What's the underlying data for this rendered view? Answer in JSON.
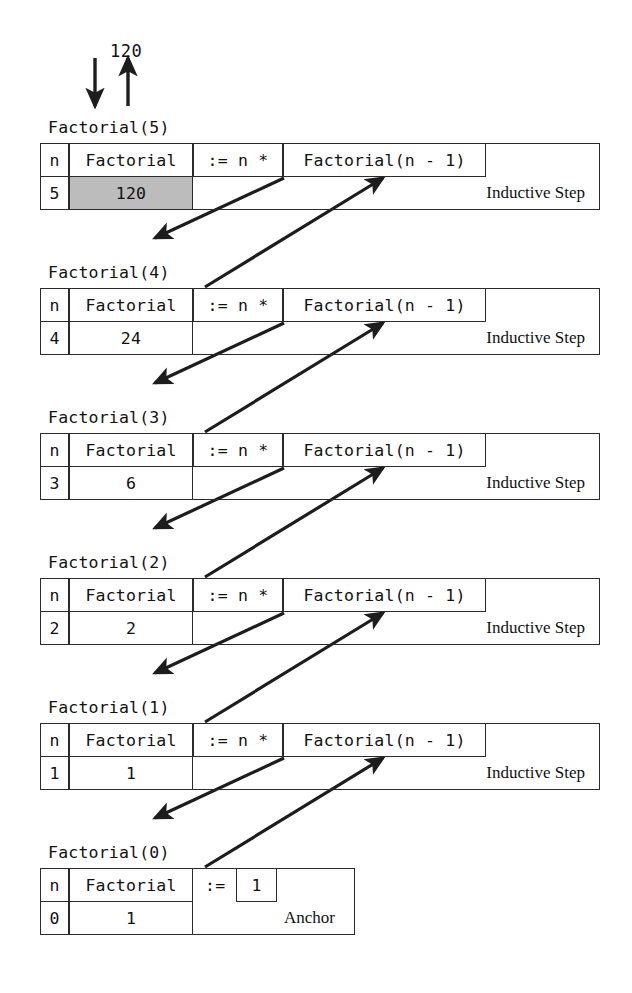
{
  "diagram": {
    "top": {
      "call_arrow_icon": "arrow-down-icon",
      "return_arrow_icon": "arrow-up-icon",
      "return_value": "120"
    },
    "columns": {
      "n_header": "n",
      "factorial_header": "Factorial",
      "assign": ":= n *",
      "recursive_call": "Factorial(n - 1)",
      "anchor_assign": ":=",
      "anchor_value": "1"
    },
    "frames": [
      {
        "title": "Factorial(5)",
        "n_header": "n",
        "factorial_header": "Factorial",
        "n_value": "5",
        "factorial_value": "120",
        "assign": ":= n *",
        "recursive_call": "Factorial(n - 1)",
        "kind_label": "Inductive Step",
        "highlighted": true
      },
      {
        "title": "Factorial(4)",
        "n_header": "n",
        "factorial_header": "Factorial",
        "n_value": "4",
        "factorial_value": "24",
        "assign": ":= n *",
        "recursive_call": "Factorial(n - 1)",
        "kind_label": "Inductive Step",
        "highlighted": false
      },
      {
        "title": "Factorial(3)",
        "n_header": "n",
        "factorial_header": "Factorial",
        "n_value": "3",
        "factorial_value": "6",
        "assign": ":= n *",
        "recursive_call": "Factorial(n - 1)",
        "kind_label": "Inductive Step",
        "highlighted": false
      },
      {
        "title": "Factorial(2)",
        "n_header": "n",
        "factorial_header": "Factorial",
        "n_value": "2",
        "factorial_value": "2",
        "assign": ":= n *",
        "recursive_call": "Factorial(n - 1)",
        "kind_label": "Inductive Step",
        "highlighted": false
      },
      {
        "title": "Factorial(1)",
        "n_header": "n",
        "factorial_header": "Factorial",
        "n_value": "1",
        "factorial_value": "1",
        "assign": ":= n *",
        "recursive_call": "Factorial(n - 1)",
        "kind_label": "Inductive Step",
        "highlighted": false
      },
      {
        "title": "Factorial(0)",
        "n_header": "n",
        "factorial_header": "Factorial",
        "n_value": "0",
        "factorial_value": "1",
        "assign": ":=",
        "recursive_call": "1",
        "kind_label": "Anchor",
        "highlighted": false,
        "anchor": true
      }
    ],
    "colors": {
      "line": "#2b2b2b",
      "shade": "#bcbcbc",
      "text": "#111111",
      "background": "#ffffff"
    }
  }
}
